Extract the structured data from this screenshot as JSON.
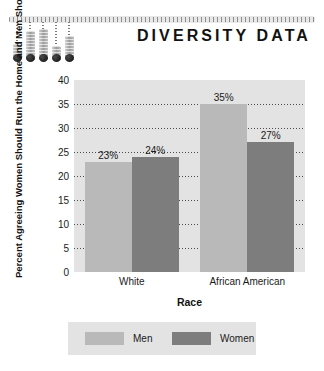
{
  "header": {
    "title": "DIVERSITY DATA",
    "decoration": {
      "name": "thermometer-gauge-graphic",
      "rail_name": "tick-rail",
      "bars": [
        {
          "height_pct": 42
        },
        {
          "height_pct": 75
        },
        {
          "height_pct": 82
        },
        {
          "height_pct": 36
        },
        {
          "height_pct": 62
        }
      ]
    }
  },
  "chart_data": {
    "type": "bar",
    "title": "DIVERSITY DATA",
    "xlabel": "Race",
    "ylabel": "Percent Agreeing Women Should Run the Home and Men Should Run the Country",
    "categories": [
      "White",
      "African American"
    ],
    "series": [
      {
        "name": "Men",
        "values": [
          23,
          35
        ],
        "color": "#b9b9b9"
      },
      {
        "name": "Women",
        "values": [
          24,
          27
        ],
        "color": "#7d7d7d"
      }
    ],
    "value_labels": [
      "23%",
      "24%",
      "35%",
      "27%"
    ],
    "ylim": [
      0,
      40
    ],
    "yticks": [
      0,
      5,
      10,
      15,
      20,
      25,
      30,
      35,
      40
    ],
    "ytick_labels": [
      "0",
      "5",
      "10",
      "15",
      "20",
      "25",
      "30",
      "35",
      "40"
    ],
    "grid": "horizontal-dotted",
    "legend_position": "bottom",
    "plot_background": "#e3e3e3"
  },
  "legend": {
    "items": [
      {
        "label": "Men",
        "color": "#b9b9b9"
      },
      {
        "label": "Women",
        "color": "#7d7d7d"
      }
    ]
  }
}
